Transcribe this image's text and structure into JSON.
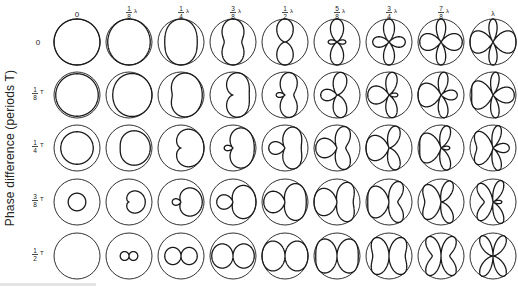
{
  "figure": {
    "y_axis_label": "Phase difference (periods T)",
    "column_headers": [
      {
        "label": "0",
        "num": "",
        "den": "",
        "unit": "",
        "spacing_lambda": 0
      },
      {
        "label": "1/8 λ",
        "num": "1",
        "den": "8",
        "unit": "λ",
        "spacing_lambda": 0.125
      },
      {
        "label": "1/4 λ",
        "num": "1",
        "den": "4",
        "unit": "λ",
        "spacing_lambda": 0.25
      },
      {
        "label": "3/8 λ",
        "num": "3",
        "den": "8",
        "unit": "λ",
        "spacing_lambda": 0.375
      },
      {
        "label": "1/2 λ",
        "num": "1",
        "den": "2",
        "unit": "λ",
        "spacing_lambda": 0.5
      },
      {
        "label": "5/8 λ",
        "num": "5",
        "den": "8",
        "unit": "λ",
        "spacing_lambda": 0.625
      },
      {
        "label": "3/4 λ",
        "num": "3",
        "den": "4",
        "unit": "λ",
        "spacing_lambda": 0.75
      },
      {
        "label": "7/8 λ",
        "num": "7",
        "den": "8",
        "unit": "λ",
        "spacing_lambda": 0.875
      },
      {
        "label": "λ",
        "num": "",
        "den": "",
        "unit": "λ",
        "spacing_lambda": 1.0
      }
    ],
    "row_headers": [
      {
        "label": "0",
        "num": "",
        "den": "",
        "unit": "",
        "phase_periods": 0
      },
      {
        "label": "1/8 T",
        "num": "1",
        "den": "8",
        "unit": "T",
        "phase_periods": 0.125
      },
      {
        "label": "1/4 T",
        "num": "1",
        "den": "4",
        "unit": "T",
        "phase_periods": 0.25
      },
      {
        "label": "3/8 T",
        "num": "3",
        "den": "8",
        "unit": "T",
        "phase_periods": 0.375
      },
      {
        "label": "1/2 T",
        "num": "1",
        "den": "2",
        "unit": "T",
        "phase_periods": 0.5
      }
    ],
    "pattern_description": "Radiation patterns of two-element array: |cos(π·(d/λ)·cosφ − π·p)| inside unit reference circle",
    "layout": {
      "col_x": [
        77,
        129,
        181,
        233,
        285,
        337,
        389,
        441,
        493
      ],
      "row_y": [
        42,
        95,
        148,
        202,
        256
      ],
      "radius": 23,
      "header_y": 14,
      "row_label_x": 38
    },
    "colors": {
      "stroke": "#1a1a1a",
      "background": "#ffffff"
    }
  }
}
